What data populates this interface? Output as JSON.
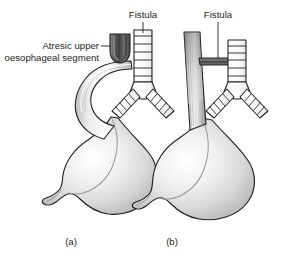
{
  "figure": {
    "background_color": "#ffffff",
    "text_color": "#231f20",
    "labels": {
      "fistula_a": "Fistula",
      "fistula_b": "Fistula",
      "atresic_line1": "Atresic upper",
      "atresic_line2": "oesophageal segment",
      "caption_a": "(a)",
      "caption_b": "(b)"
    },
    "colors": {
      "outline": "#231f20",
      "organ_light": "#f2f2f2",
      "organ_mid": "#d9d9d9",
      "organ_shadow": "#a8a8a8",
      "pouch_dark": "#4d4d4d",
      "airway_fill": "#fbfbfb"
    },
    "panels": [
      {
        "id": "a",
        "caption": "(a)",
        "description": "Oesophageal atresia with distal tracheo-oesophageal fistula",
        "parts": [
          "atresic-upper-oesophageal-pouch",
          "trachea",
          "right-bronchus",
          "left-bronchus",
          "distal-oesophagus",
          "stomach",
          "duodenum"
        ]
      },
      {
        "id": "b",
        "caption": "(b)",
        "description": "Intact oesophagus with H-type tracheo-oesophageal fistula",
        "parts": [
          "continuous-oesophagus",
          "horizontal-fistula",
          "trachea",
          "right-bronchus",
          "left-bronchus",
          "stomach",
          "duodenum"
        ]
      }
    ]
  }
}
